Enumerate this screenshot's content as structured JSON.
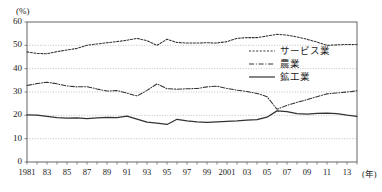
{
  "chart_data": {
    "type": "line",
    "title": "",
    "subtitle": "",
    "xlabel": "年",
    "ylabel": "(%)",
    "ylim": [
      0,
      60
    ],
    "xlim": [
      1981,
      2014
    ],
    "ytick_values": [
      0,
      10,
      20,
      30,
      40,
      50,
      60
    ],
    "ytick_labels": [
      "0",
      "10",
      "20",
      "30",
      "40",
      "50",
      "60"
    ],
    "xtick_values": [
      1981,
      1983,
      1985,
      1987,
      1989,
      1991,
      1993,
      1995,
      1997,
      1999,
      2001,
      2003,
      2005,
      2007,
      2009,
      2011,
      2013
    ],
    "xtick_labels": [
      "1981",
      "83",
      "85",
      "87",
      "89",
      "91",
      "93",
      "95",
      "97",
      "99",
      "2001",
      "03",
      "05",
      "07",
      "09",
      "11",
      "13"
    ],
    "x": [
      1981,
      1982,
      1983,
      1984,
      1985,
      1986,
      1987,
      1988,
      1989,
      1990,
      1991,
      1992,
      1993,
      1994,
      1995,
      1996,
      1997,
      1998,
      1999,
      2000,
      2001,
      2002,
      2003,
      2004,
      2005,
      2006,
      2007,
      2008,
      2009,
      2010,
      2011,
      2012,
      2013,
      2014
    ],
    "grid": true,
    "grid_axis": "y",
    "legend_position": "inside-right",
    "series": [
      {
        "name": "サービス業",
        "style": "dotted",
        "color": "#333333",
        "values": [
          47.2,
          46.5,
          46.4,
          47.3,
          48.0,
          48.7,
          50.0,
          50.6,
          51.1,
          51.6,
          52.2,
          53.0,
          52.0,
          50.0,
          52.6,
          51.2,
          51.0,
          51.0,
          51.1,
          51.0,
          51.6,
          53.0,
          53.3,
          53.3,
          54.0,
          54.7,
          54.4,
          53.6,
          52.6,
          51.4,
          50.0,
          50.2,
          50.4,
          50.4
        ]
      },
      {
        "name": "農業",
        "style": "dash-dot",
        "color": "#333333",
        "values": [
          32.8,
          33.6,
          34.2,
          33.5,
          32.6,
          32.2,
          32.3,
          31.3,
          30.4,
          30.6,
          29.5,
          28.3,
          30.7,
          33.5,
          31.4,
          31.2,
          31.4,
          31.5,
          32.2,
          32.5,
          31.5,
          30.8,
          30.2,
          29.4,
          28.0,
          22.6,
          24.3,
          25.6,
          26.7,
          28.0,
          29.2,
          29.6,
          30.0,
          30.5
        ]
      },
      {
        "name": "鉱工業",
        "style": "solid",
        "color": "#333333",
        "values": [
          20.2,
          20.1,
          19.6,
          19.0,
          18.8,
          18.9,
          18.6,
          18.9,
          19.1,
          19.0,
          19.7,
          18.4,
          17.1,
          16.7,
          16.1,
          18.3,
          17.6,
          17.2,
          17.0,
          17.2,
          17.4,
          17.6,
          17.9,
          18.2,
          19.2,
          21.9,
          21.6,
          20.7,
          20.5,
          20.8,
          20.9,
          20.7,
          20.1,
          19.6
        ]
      }
    ]
  }
}
